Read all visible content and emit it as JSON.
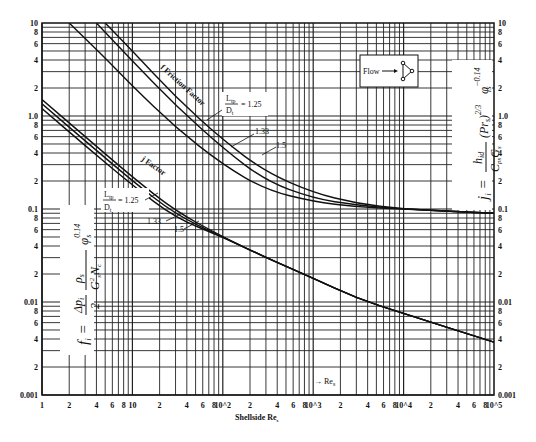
{
  "chart_data": {
    "type": "line",
    "xlabel": "Shellside Re_s",
    "ylabel_left": "f_i = (Δp_i / 2)(ρ_s / (G_s^2 N_c)) φ_s^0.14",
    "ylabel_right": "j_i = (h_id / (C_ps G_s)) (Pr_s)^(2/3) φ_s^-0.14",
    "xscale": "log",
    "yscale": "log",
    "xlim": [
      1,
      100000
    ],
    "ylim": [
      0.001,
      10
    ],
    "grid": true,
    "x_tick_labels": [
      "1",
      "2",
      "4",
      "6",
      "8",
      "10",
      "2",
      "4",
      "6",
      "8",
      "10^2",
      "2",
      "4",
      "6",
      "8",
      "10^3",
      "2",
      "4",
      "6",
      "8",
      "10^4",
      "2",
      "4",
      "6",
      "8",
      "10^5"
    ],
    "y_tick_labels_left": [
      "10",
      "8",
      "6",
      "4",
      "2",
      "1.0",
      "8",
      "6",
      "4",
      "2",
      "0.1",
      "8",
      "6",
      "4",
      "2",
      "0.01",
      "8",
      "6",
      "4",
      "2",
      "0.001"
    ],
    "y_tick_labels_right": [
      "10",
      "8",
      "6",
      "4",
      "2",
      "1.0",
      "8",
      "6",
      "4",
      "2",
      "0.1",
      "8",
      "6",
      "4",
      "2",
      "0.01",
      "8",
      "6",
      "4",
      "2",
      "0.001"
    ],
    "series": [
      {
        "name": "f Friction Factor, Ltp/Dt = 1.25",
        "x": [
          2,
          5,
          10,
          30,
          100,
          300,
          1000,
          3000,
          10000,
          30000,
          100000
        ],
        "y": [
          10,
          4.2,
          2.1,
          0.75,
          0.3,
          0.16,
          0.12,
          0.105,
          0.1,
          0.095,
          0.09
        ]
      },
      {
        "name": "f Friction Factor, Ltp/Dt = 1.33",
        "x": [
          4,
          10,
          30,
          100,
          300,
          1000,
          3000,
          10000,
          30000,
          100000
        ],
        "y": [
          10,
          3.9,
          1.3,
          0.45,
          0.2,
          0.13,
          0.11,
          0.1,
          0.095,
          0.09
        ]
      },
      {
        "name": "f Friction Factor, Ltp/Dt = 1.5",
        "x": [
          5,
          10,
          30,
          100,
          300,
          1000,
          3000,
          10000,
          30000,
          100000
        ],
        "y": [
          10,
          5,
          1.6,
          0.55,
          0.25,
          0.15,
          0.115,
          0.1,
          0.095,
          0.09
        ]
      },
      {
        "name": "j Factor, Ltp/Dt = 1.25",
        "x": [
          1,
          3,
          10,
          30,
          100,
          300,
          1000,
          3000,
          10000,
          100000
        ],
        "y": [
          1.5,
          0.6,
          0.22,
          0.095,
          0.05,
          0.03,
          0.018,
          0.011,
          0.0075,
          0.0037
        ]
      },
      {
        "name": "j Factor, Ltp/Dt = 1.33",
        "x": [
          1,
          3,
          10,
          30,
          100,
          300,
          1000,
          3000,
          10000,
          100000
        ],
        "y": [
          1.35,
          0.54,
          0.2,
          0.087,
          0.05,
          0.03,
          0.018,
          0.011,
          0.0075,
          0.0037
        ]
      },
      {
        "name": "j Factor, Ltp/Dt = 1.5",
        "x": [
          1,
          3,
          10,
          30,
          100,
          300,
          1000,
          3000,
          10000,
          100000
        ],
        "y": [
          1.2,
          0.48,
          0.18,
          0.08,
          0.05,
          0.03,
          0.018,
          0.011,
          0.0075,
          0.0037
        ]
      }
    ],
    "annotations": [
      "f Friction Factor",
      "j Factor",
      "Ltp/Dt = 1.25",
      "1.33",
      "1.5",
      "→ Re_s",
      "Flow →"
    ]
  },
  "labels": {
    "friction_factor": "f Friction Factor",
    "j_factor": "j Factor",
    "ratio_top": "L",
    "ratio_top_sub": "tp",
    "ratio_bottom": "D",
    "ratio_bottom_sub": "t",
    "ratio_value": "= 1.25",
    "r133": "1.33",
    "r15": "1.5",
    "re_arrow": "→ Re",
    "re_sub": "s",
    "xlabel": "Shellside Re",
    "xlabel_sub": "s",
    "flow": "Flow",
    "eq_left": "f",
    "eq_right": "j"
  }
}
